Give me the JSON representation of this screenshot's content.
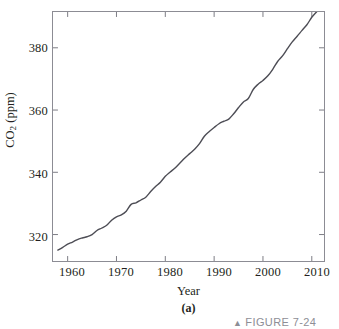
{
  "figure": {
    "subfigure_label": "(a)",
    "caption_fragment": "FIGURE 7-24",
    "caption_marker": "▲"
  },
  "chart_data": {
    "type": "line",
    "title": "",
    "xlabel": "Year",
    "ylabel": "CO2 (ppm)",
    "ylabel_rich": {
      "prefix": "CO",
      "subscript": "2",
      "suffix": " (ppm)"
    },
    "xlim": [
      1957.0,
      2012.5
    ],
    "ylim": [
      311.5,
      391.5
    ],
    "xticks": [
      1960,
      1970,
      1980,
      1990,
      2000,
      2010
    ],
    "xtick_labels": [
      "1960",
      "1970",
      "1980",
      "1990",
      "2000",
      "2010"
    ],
    "yticks": [
      320,
      340,
      360,
      380
    ],
    "ytick_labels": [
      "320",
      "340",
      "360",
      "380"
    ],
    "grid": false,
    "legend": false,
    "tick_direction": "in",
    "line_color": "#4d4d55",
    "line_width": 1.4,
    "series": [
      {
        "name": "Atmospheric CO2 concentration",
        "x": [
          1958,
          1959,
          1960,
          1961,
          1962,
          1963,
          1964,
          1965,
          1966,
          1967,
          1968,
          1969,
          1970,
          1971,
          1972,
          1973,
          1974,
          1975,
          1976,
          1977,
          1978,
          1979,
          1980,
          1981,
          1982,
          1983,
          1984,
          1985,
          1986,
          1987,
          1988,
          1989,
          1990,
          1991,
          1992,
          1993,
          1994,
          1995,
          1996,
          1997,
          1998,
          1999,
          2000,
          2001,
          2002,
          2003,
          2004,
          2005,
          2006,
          2007,
          2008,
          2009,
          2010,
          2011
        ],
        "y": [
          315.0,
          315.9,
          316.9,
          317.6,
          318.4,
          318.9,
          319.3,
          320.0,
          321.3,
          322.1,
          323.0,
          324.6,
          325.7,
          326.3,
          327.5,
          329.7,
          330.2,
          331.1,
          332.0,
          333.8,
          335.4,
          336.8,
          338.7,
          340.1,
          341.4,
          343.0,
          344.6,
          346.0,
          347.4,
          349.2,
          351.6,
          353.1,
          354.4,
          355.6,
          356.4,
          357.1,
          358.8,
          360.8,
          362.6,
          363.7,
          366.6,
          368.3,
          369.5,
          371.0,
          373.1,
          375.6,
          377.4,
          379.7,
          381.9,
          383.7,
          385.6,
          387.4,
          389.8,
          391.6
        ],
        "marker": "none"
      }
    ],
    "annotations": []
  }
}
